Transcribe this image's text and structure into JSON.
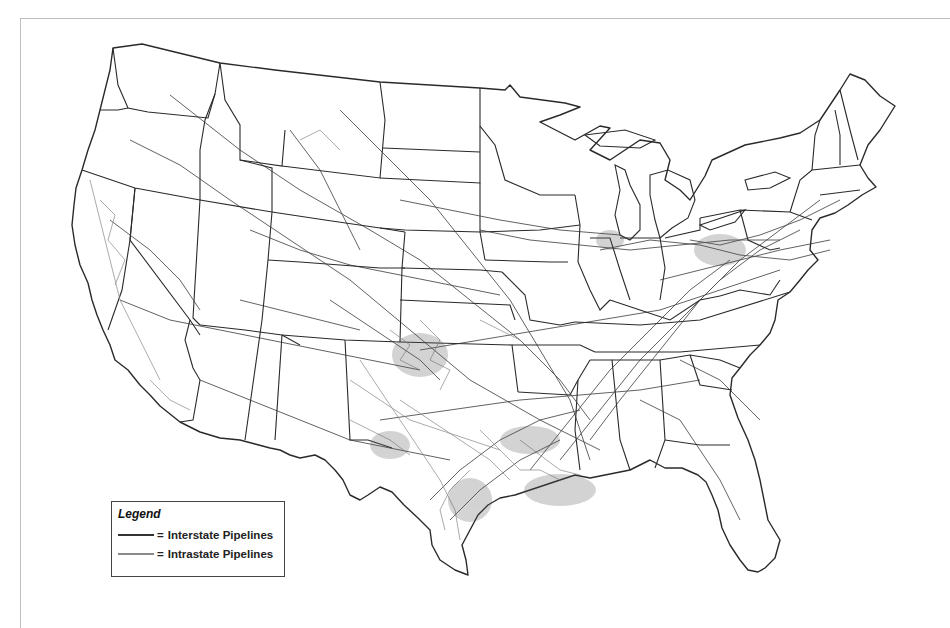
{
  "map": {
    "subject": "Natural gas pipeline network, contiguous United States",
    "colors": {
      "interstate": "#333333",
      "intrastate": "#8a8a8a",
      "boundary": "#2a2a2a",
      "background": "#ffffff",
      "frame": "#bdbdbd"
    }
  },
  "legend": {
    "title": "Legend",
    "items": [
      {
        "label": "Interstate Pipelines",
        "prefix": "=",
        "color": "#333333"
      },
      {
        "label": "Intrastate Pipelines",
        "prefix": "=",
        "color": "#8a8a8a"
      }
    ]
  }
}
